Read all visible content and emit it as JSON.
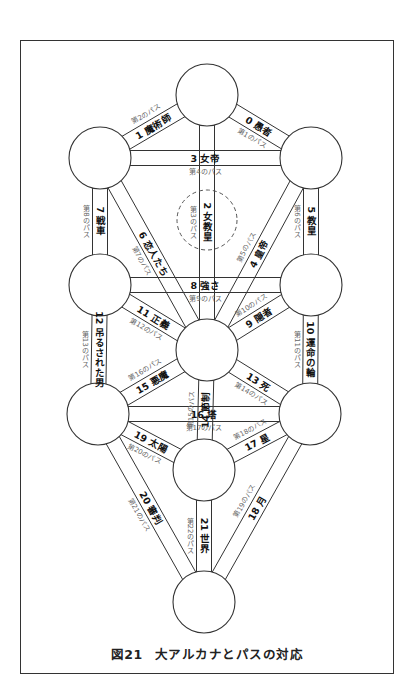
{
  "figure": {
    "caption_number": "図21",
    "caption_title": "大アルカナとパスの対応"
  },
  "colors": {
    "line": "#333333",
    "label": "#111111",
    "path_label": "#666666",
    "background": "#ffffff"
  },
  "nodes": [
    {
      "id": "n1",
      "cx": 207,
      "cy": 95
    },
    {
      "id": "n2",
      "cx": 311,
      "cy": 158
    },
    {
      "id": "n3",
      "cx": 100,
      "cy": 158
    },
    {
      "id": "n4",
      "cx": 311,
      "cy": 285
    },
    {
      "id": "n5",
      "cx": 100,
      "cy": 285
    },
    {
      "id": "n6",
      "cx": 207,
      "cy": 350
    },
    {
      "id": "n7",
      "cx": 310,
      "cy": 414
    },
    {
      "id": "n8",
      "cx": 98,
      "cy": 414
    },
    {
      "id": "n9",
      "cx": 204,
      "cy": 470
    },
    {
      "id": "n10",
      "cx": 204,
      "cy": 602
    }
  ],
  "daath": {
    "cx": 207,
    "cy": 220,
    "r": 30,
    "style": "dashed"
  },
  "paths": [
    {
      "from": "n1",
      "to": "n2",
      "card": "0 愚者",
      "path": "第1のパス"
    },
    {
      "from": "n1",
      "to": "n3",
      "card": "1 魔術師",
      "path": "第2のパス"
    },
    {
      "from": "n1",
      "to": "n6",
      "card": "2 女教皇",
      "path": "第3のパス"
    },
    {
      "from": "n3",
      "to": "n2",
      "card": "3 女帝",
      "path": "第4のパス"
    },
    {
      "from": "n2",
      "to": "n6",
      "card": "4 皇帝",
      "path": "第5のパス"
    },
    {
      "from": "n2",
      "to": "n4",
      "card": "5 教皇",
      "path": "第6のパス"
    },
    {
      "from": "n3",
      "to": "n6",
      "card": "6 恋人たち",
      "path": "第7のパス"
    },
    {
      "from": "n3",
      "to": "n5",
      "card": "7 戦車",
      "path": "第8のパス"
    },
    {
      "from": "n5",
      "to": "n4",
      "card": "8 強さ",
      "path": "第9のパス"
    },
    {
      "from": "n4",
      "to": "n6",
      "card": "9 隠者",
      "path": "第10のパス"
    },
    {
      "from": "n4",
      "to": "n7",
      "card": "10 運命の輪",
      "path": "第11のパス"
    },
    {
      "from": "n5",
      "to": "n6",
      "card": "11 正義",
      "path": "第12のパス"
    },
    {
      "from": "n5",
      "to": "n8",
      "card": "12 吊るされた男",
      "path": "第13のパス"
    },
    {
      "from": "n6",
      "to": "n7",
      "card": "13 死",
      "path": "第14のパス"
    },
    {
      "from": "n6",
      "to": "n9",
      "card": "14 節制",
      "path": "第15のパス"
    },
    {
      "from": "n6",
      "to": "n8",
      "card": "15 悪魔",
      "path": "第16のパス"
    },
    {
      "from": "n8",
      "to": "n7",
      "card": "16 塔",
      "path": "第17のパス"
    },
    {
      "from": "n7",
      "to": "n9",
      "card": "17 星",
      "path": "第18のパス"
    },
    {
      "from": "n7",
      "to": "n10",
      "card": "18 月",
      "path": "第19のパス"
    },
    {
      "from": "n8",
      "to": "n9",
      "card": "19 太陽",
      "path": "第20のパス"
    },
    {
      "from": "n8",
      "to": "n10",
      "card": "20 審判",
      "path": "第21のパス"
    },
    {
      "from": "n9",
      "to": "n10",
      "card": "21 世界",
      "path": "第22のパス"
    }
  ]
}
